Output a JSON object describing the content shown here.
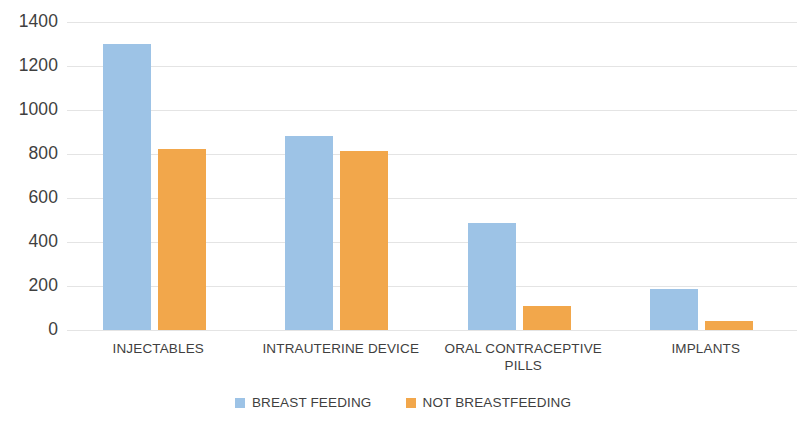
{
  "chart_data": {
    "type": "bar",
    "title": "",
    "subtitle": "",
    "xlabel": "",
    "ylabel": "",
    "categories": [
      "INJECTABLES",
      "INTRAUTERINE DEVICE",
      "ORAL CONTRACEPTIVE PILLS",
      "IMPLANTS"
    ],
    "series": [
      {
        "name": "BREAST FEEDING",
        "color": "#9DC3E6",
        "values": [
          1300,
          880,
          485,
          185
        ]
      },
      {
        "name": "NOT BREASTFEEDING",
        "color": "#F2A74B",
        "values": [
          825,
          815,
          110,
          40
        ]
      }
    ],
    "ylim": [
      0,
      1400
    ],
    "ytick_labels": [
      "1400",
      "1200",
      "1000",
      "800",
      "600",
      "400",
      "200",
      "0"
    ],
    "ytick_values": [
      1400,
      1200,
      1000,
      800,
      600,
      400,
      200,
      0
    ],
    "grid": true,
    "grid_axis": "y",
    "legend_position": "bottom",
    "background_color": "#FFFFFF",
    "gridline_color": "#E4E4E4",
    "text_color": "#3F3F3F"
  },
  "legend": {
    "items": [
      {
        "label": "BREAST FEEDING",
        "swatch_icon": "legend-swatch-blue"
      },
      {
        "label": "NOT BREASTFEEDING",
        "swatch_icon": "legend-swatch-orange"
      }
    ]
  }
}
